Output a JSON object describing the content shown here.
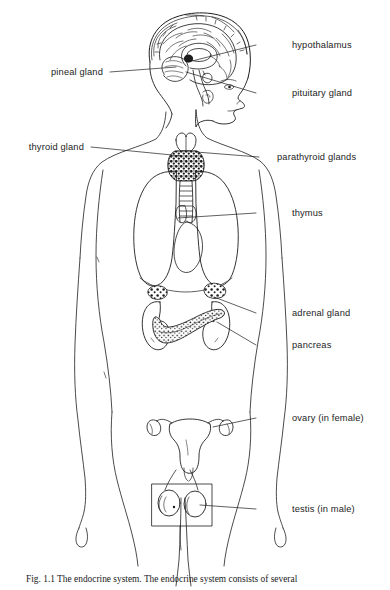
{
  "figure": {
    "title": "The endocrine system",
    "caption_label": "Fig. 1.1",
    "caption_text": "The endocrine system. The endocrine system consists of several",
    "background_color": "#ffffff",
    "line_color": "#1d1d1d",
    "view": "female body, anterior view, with sagittal head inset"
  },
  "labels": [
    {
      "id": "hypothalamus",
      "text": "hypothalamus",
      "side": "right",
      "text_x": 292,
      "text_y": 41,
      "leader_from_x": 256,
      "leader_from_y": 45,
      "leader_to_x": 188,
      "leader_to_y": 62
    },
    {
      "id": "pineal-gland",
      "text": "pineal gland",
      "side": "left",
      "text_x": 103,
      "text_y": 68,
      "leader_from_x": 110,
      "leader_from_y": 72,
      "leader_to_x": 176,
      "leader_to_y": 67
    },
    {
      "id": "pituitary-gland",
      "text": "pituitary gland",
      "side": "right",
      "text_x": 292,
      "text_y": 89,
      "leader_from_x": 256,
      "leader_from_y": 93,
      "leader_to_x": 186,
      "leader_to_y": 72
    },
    {
      "id": "thyroid-gland",
      "text": "thyroid gland",
      "side": "left",
      "text_x": 84,
      "text_y": 143,
      "leader_from_x": 91,
      "leader_from_y": 147,
      "leader_to_x": 182,
      "leader_to_y": 156
    },
    {
      "id": "parathyroid-glands",
      "text": "parathyroid glands",
      "side": "right",
      "text_x": 277,
      "text_y": 153,
      "leader_from_x": 259,
      "leader_from_y": 157,
      "leader_to_x": 196,
      "leader_to_y": 152
    },
    {
      "id": "thymus",
      "text": "thymus",
      "side": "right",
      "text_x": 292,
      "text_y": 209,
      "leader_from_x": 256,
      "leader_from_y": 213,
      "leader_to_x": 178,
      "leader_to_y": 218
    },
    {
      "id": "adrenal-gland",
      "text": "adrenal gland",
      "side": "right",
      "text_x": 292,
      "text_y": 309,
      "leader_from_x": 256,
      "leader_from_y": 313,
      "leader_to_x": 214,
      "leader_to_y": 297
    },
    {
      "id": "pancreas",
      "text": "pancreas",
      "side": "right",
      "text_x": 292,
      "text_y": 341,
      "leader_from_x": 256,
      "leader_from_y": 345,
      "leader_to_x": 217,
      "leader_to_y": 322
    },
    {
      "id": "ovary-in-female",
      "text": "ovary (in female)",
      "side": "right",
      "text_x": 292,
      "text_y": 414,
      "leader_from_x": 256,
      "leader_from_y": 418,
      "leader_to_x": 213,
      "leader_to_y": 427
    },
    {
      "id": "testis-in-male",
      "text": "testis (in male)",
      "side": "right",
      "text_x": 292,
      "text_y": 505,
      "leader_from_x": 256,
      "leader_from_y": 509,
      "leader_to_x": 200,
      "leader_to_y": 505
    }
  ],
  "organs": [
    {
      "id": "head-sagittal",
      "name": "head sagittal section with brain"
    },
    {
      "id": "brain-cerebrum",
      "name": "cerebrum"
    },
    {
      "id": "brain-cerebellum",
      "name": "cerebellum"
    },
    {
      "id": "pineal-body",
      "name": "pineal body"
    },
    {
      "id": "pituitary-body",
      "name": "pituitary body"
    },
    {
      "id": "thyroid-body",
      "name": "thyroid gland"
    },
    {
      "id": "trachea",
      "name": "trachea"
    },
    {
      "id": "lung-left",
      "name": "left lung"
    },
    {
      "id": "lung-right",
      "name": "right lung"
    },
    {
      "id": "heart",
      "name": "heart"
    },
    {
      "id": "thymus-body",
      "name": "thymus"
    },
    {
      "id": "kidney-left",
      "name": "left kidney"
    },
    {
      "id": "kidney-right",
      "name": "right kidney"
    },
    {
      "id": "adrenal-left",
      "name": "left adrenal gland"
    },
    {
      "id": "adrenal-right",
      "name": "right adrenal gland"
    },
    {
      "id": "pancreas-body",
      "name": "pancreas"
    },
    {
      "id": "uterus",
      "name": "uterus with fallopian tubes"
    },
    {
      "id": "ovary-left",
      "name": "left ovary"
    },
    {
      "id": "ovary-right",
      "name": "right ovary"
    },
    {
      "id": "testis-left",
      "name": "left testis"
    },
    {
      "id": "testis-right",
      "name": "right testis"
    },
    {
      "id": "testis-inset-box",
      "name": "testis inset box"
    },
    {
      "id": "body-outline",
      "name": "female body outline"
    }
  ]
}
